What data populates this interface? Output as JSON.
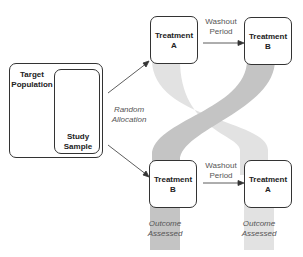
{
  "diagram": {
    "type": "crossover-trial",
    "population": {
      "outer_label": "Target Population",
      "inner_label": "Study Sample"
    },
    "allocation_label": "Random Allocation",
    "arms": [
      {
        "first": "Treatment A",
        "washout": "Washout Period",
        "second": "Treatment B"
      },
      {
        "first": "Treatment B",
        "washout": "Washout Period",
        "second": "Treatment A",
        "outcome_first": "Outcome Assessed",
        "outcome_second": "Outcome Assessed"
      }
    ],
    "colors": {
      "band_light": "#e2e2e2",
      "band_dark": "#c4c4c4",
      "border": "#333333"
    }
  },
  "labels": {
    "target": "Target",
    "population": "Population",
    "study": "Study",
    "sample": "Sample",
    "random": "Random",
    "allocation": "Allocation",
    "treatment": "Treatment",
    "a": "A",
    "b": "B",
    "washout": "Washout",
    "period": "Period",
    "outcome": "Outcome",
    "assessed": "Assessed"
  }
}
